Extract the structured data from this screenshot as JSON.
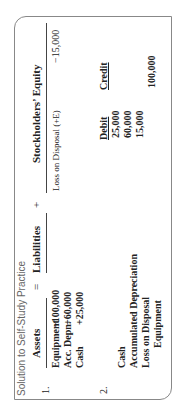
{
  "title": "Solution to Self-Study Practice",
  "part1": {
    "number": "1.",
    "headers": {
      "assets": "Assets",
      "eq": "=",
      "liabilities": "Liabilities",
      "plus": "+",
      "equity": "Stockholders’ Equity"
    },
    "assets_rows": [
      {
        "label": "Equipment",
        "value": "−100,000"
      },
      {
        "label": "Acc. Depn.",
        "value": "+60,000"
      },
      {
        "label": "Cash",
        "value": "+25,000"
      }
    ],
    "equity_rows": [
      {
        "label": "Loss on Disposal (+E)",
        "value": "−15,000"
      }
    ]
  },
  "part2": {
    "number": "2.",
    "col_debit": "Debit",
    "col_credit": "Credit",
    "rows": [
      {
        "account": "Cash",
        "debit": "25,000",
        "credit": ""
      },
      {
        "account": "Accumulated Depreciation",
        "debit": "60,000",
        "credit": ""
      },
      {
        "account": "Loss on Disposal",
        "debit": "15,000",
        "credit": ""
      },
      {
        "account": "Equipment",
        "debit": "",
        "credit": "100,000"
      }
    ]
  }
}
